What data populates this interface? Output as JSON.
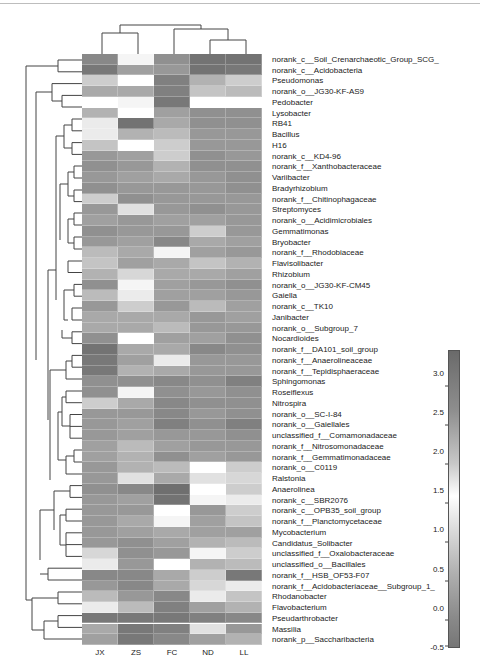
{
  "chart_data": {
    "type": "heatmap",
    "title": "",
    "xlabel": "",
    "ylabel": "",
    "columns": [
      "JX",
      "ZS",
      "FC",
      "ND",
      "LL"
    ],
    "rows": [
      "norank_c__Soil_Crenarchaeotic_Group_SCG_",
      "norank_c__Acidobacteria",
      "Pseudomonas",
      "norank_o__JG30-KF-AS9",
      "Pedobacter",
      "Lysobacter",
      "RB41",
      "Bacillus",
      "H16",
      "norank_c__KD4-96",
      "norank_f__Xanthobacteraceae",
      "Variibacter",
      "Bradyrhizobium",
      "norank_f__Chitinophagaceae",
      "Streptomyces",
      "norank_o__Acidimicrobiales",
      "Gemmatimonas",
      "Bryobacter",
      "norank_f__Rhodobiaceae",
      "Flavisolibacter",
      "Rhizobium",
      "norank_o__JG30-KF-CM45",
      "Gaiella",
      "norank_c__TK10",
      "Janibacter",
      "norank_o__Subgroup_7",
      "Nocardioides",
      "norank_f__DA101_soil_group",
      "norank_f__Anaerolineaceae",
      "norank_f__Tepidisphaeraceae",
      "Sphingomonas",
      "Roseiflexus",
      "Nitrospira",
      "norank_o__SC-I-84",
      "norank_o__Gaiellales",
      "unclassified_f__Comamonadaceae",
      "norank_f__Nitrosomonadaceae",
      "norank_f__Gemmatimonadaceae",
      "norank_o__C0119",
      "Ralstonia",
      "Anaerolinea",
      "norank_c__SBR2076",
      "norank_c__OPB35_soil_group",
      "norank_f__Planctomycetaceae",
      "Mycobacterium",
      "Candidatus_Solibacter",
      "unclassified_f__Oxalobacteraceae",
      "unclassified_o__Bacillales",
      "norank_f__HSB_OF53-F07",
      "norank_f__Acidobacteriaceae__Subgroup_1_",
      "Rhodanobacter",
      "Flavobacterium",
      "Pseudarthrobacter",
      "Massilia",
      "norank_p__Saccharibacteria"
    ],
    "values": [
      [
        2.8,
        1.6,
        2.7,
        3.1,
        3.1
      ],
      [
        3.0,
        2.5,
        2.6,
        3.1,
        3.0
      ],
      [
        2.0,
        1.5,
        2.9,
        2.3,
        2.0
      ],
      [
        2.4,
        2.4,
        2.9,
        2.1,
        2.2
      ],
      [
        1.5,
        1.6,
        3.0,
        1.5,
        1.5
      ],
      [
        2.3,
        1.5,
        2.5,
        2.7,
        2.7
      ],
      [
        1.7,
        3.1,
        2.4,
        2.7,
        2.7
      ],
      [
        1.7,
        2.3,
        2.2,
        2.6,
        2.6
      ],
      [
        2.1,
        1.5,
        2.0,
        2.6,
        2.6
      ],
      [
        2.6,
        2.5,
        2.0,
        2.7,
        2.6
      ],
      [
        2.7,
        2.6,
        2.3,
        2.7,
        2.7
      ],
      [
        2.6,
        2.5,
        2.4,
        2.6,
        2.7
      ],
      [
        2.7,
        2.6,
        2.6,
        2.6,
        2.7
      ],
      [
        2.0,
        2.7,
        2.6,
        2.6,
        2.6
      ],
      [
        2.6,
        1.8,
        2.6,
        2.7,
        2.6
      ],
      [
        2.5,
        2.6,
        2.5,
        2.5,
        2.6
      ],
      [
        2.7,
        2.6,
        2.6,
        2.0,
        2.6
      ],
      [
        2.6,
        2.5,
        2.8,
        2.4,
        2.5
      ],
      [
        2.2,
        2.4,
        1.6,
        2.5,
        2.6
      ],
      [
        2.1,
        2.5,
        2.4,
        2.1,
        2.3
      ],
      [
        2.3,
        1.9,
        2.4,
        2.4,
        2.5
      ],
      [
        2.7,
        1.6,
        2.5,
        2.6,
        2.7
      ],
      [
        2.2,
        1.7,
        2.5,
        2.5,
        2.6
      ],
      [
        2.6,
        2.0,
        2.6,
        2.2,
        2.5
      ],
      [
        2.4,
        2.4,
        2.4,
        2.6,
        2.5
      ],
      [
        2.4,
        2.4,
        2.2,
        2.6,
        2.6
      ],
      [
        2.7,
        1.5,
        2.5,
        2.5,
        2.7
      ],
      [
        3.1,
        2.4,
        2.4,
        2.8,
        2.7
      ],
      [
        3.0,
        2.5,
        1.7,
        2.6,
        2.6
      ],
      [
        3.0,
        2.3,
        2.4,
        2.6,
        2.6
      ],
      [
        2.7,
        2.7,
        2.8,
        2.7,
        2.9
      ],
      [
        2.7,
        1.6,
        2.7,
        2.6,
        2.7
      ],
      [
        2.0,
        2.4,
        2.8,
        2.7,
        2.7
      ],
      [
        2.6,
        2.6,
        2.8,
        2.6,
        2.7
      ],
      [
        2.6,
        2.5,
        2.9,
        2.7,
        2.9
      ],
      [
        2.6,
        2.5,
        2.6,
        2.6,
        2.7
      ],
      [
        2.5,
        2.2,
        2.5,
        2.6,
        2.6
      ],
      [
        2.5,
        2.3,
        2.7,
        2.5,
        2.6
      ],
      [
        2.6,
        2.3,
        2.2,
        1.5,
        2.0
      ],
      [
        2.6,
        1.8,
        2.4,
        1.8,
        1.9
      ],
      [
        2.7,
        2.8,
        3.2,
        1.5,
        2.0
      ],
      [
        2.6,
        2.5,
        3.1,
        1.6,
        1.7
      ],
      [
        2.6,
        2.6,
        1.5,
        2.6,
        2.0
      ],
      [
        2.6,
        2.4,
        1.6,
        2.5,
        2.1
      ],
      [
        2.6,
        2.5,
        2.4,
        2.5,
        2.5
      ],
      [
        2.6,
        2.7,
        2.5,
        2.3,
        2.2
      ],
      [
        1.9,
        2.7,
        2.6,
        1.6,
        2.0
      ],
      [
        1.7,
        2.6,
        1.5,
        2.3,
        2.2
      ],
      [
        2.8,
        2.8,
        2.4,
        2.0,
        3.0
      ],
      [
        2.6,
        2.8,
        2.4,
        1.9,
        1.7
      ],
      [
        2.2,
        2.6,
        2.8,
        1.7,
        2.1
      ],
      [
        1.7,
        2.2,
        2.9,
        2.5,
        2.3
      ],
      [
        3.0,
        3.0,
        3.0,
        2.9,
        2.8
      ],
      [
        2.4,
        3.0,
        2.9,
        1.8,
        2.6
      ],
      [
        2.5,
        3.0,
        2.8,
        2.5,
        2.3
      ]
    ],
    "colorbar": {
      "min": -0.5,
      "max": 3.3,
      "ticks": [
        "3.0",
        "2.5",
        "2.0",
        "1.5",
        "1.0",
        "0.5",
        "0.0",
        "-0.5"
      ],
      "tick_values": [
        3.0,
        2.5,
        2.0,
        1.5,
        1.0,
        0.5,
        0.0,
        -0.5
      ],
      "colormap": "grayscale diverging: dark gray high, white ~1.5, gray low"
    },
    "column_dendrogram": "((JX,ZS),(FC,(ND,LL)))",
    "row_dendrogram": true,
    "legend_position": "right"
  }
}
